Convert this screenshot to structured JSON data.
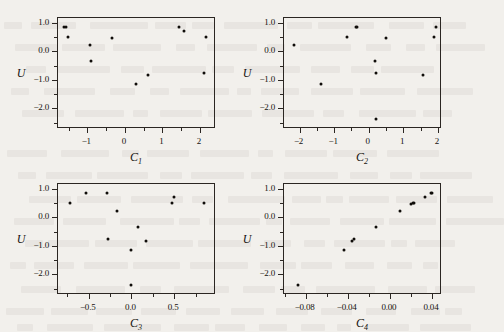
{
  "figure": {
    "background_color": "#f2f0ec",
    "ink_color": "#16130f",
    "layout": "2x2 grid of scatter plots",
    "ylabel": "U",
    "panels": [
      {
        "name": "panel-c1",
        "xlabel": "C",
        "xlabel_sub": "1",
        "xticks": [
          -1,
          0,
          1,
          2
        ],
        "xtick_labels": [
          "-1",
          "0",
          "1",
          "2"
        ],
        "xlim": [
          -1.78,
          2.43
        ],
        "yticks": [
          1.0,
          0.0,
          -1.0,
          -2.0
        ],
        "ytick_labels": [
          "1.0",
          "0.0",
          "-1.0",
          "-2.0"
        ],
        "ylim": [
          -2.72,
          1.17
        ]
      },
      {
        "name": "panel-c2",
        "xlabel": "C",
        "xlabel_sub": "2",
        "xticks": [
          -2,
          -1,
          0,
          1,
          2
        ],
        "xtick_labels": [
          "-2",
          "-1",
          "0",
          "1",
          "2"
        ],
        "xlim": [
          -2.45,
          2.12
        ],
        "yticks": [
          1.0,
          0.0,
          -1.0,
          -2.0
        ],
        "ytick_labels": [
          "1.0",
          "0.0",
          "-1.0",
          "-2.0"
        ],
        "ylim": [
          -2.72,
          1.17
        ]
      },
      {
        "name": "panel-c3",
        "xlabel": "C",
        "xlabel_sub": "3",
        "xticks": [
          -0.5,
          0.0,
          0.5
        ],
        "xtick_labels": [
          "-0.5",
          "0.0",
          "0.5"
        ],
        "xlim": [
          -0.86,
          0.99
        ],
        "yticks": [
          1.0,
          0.0,
          -1.0,
          -2.0
        ],
        "ytick_labels": [
          "1.0",
          "0.0",
          "-1.0",
          "-2.0"
        ],
        "ylim": [
          -2.72,
          1.17
        ]
      },
      {
        "name": "panel-c4",
        "xlabel": "C",
        "xlabel_sub": "4",
        "xticks": [
          -0.08,
          -0.04,
          0.0,
          0.04
        ],
        "xtick_labels": [
          "-0.08",
          "-0.04",
          "0.00",
          "0.04"
        ],
        "xlim": [
          -0.1005,
          0.0495
        ],
        "yticks": [
          1.0,
          0.0,
          -1.0,
          -2.0
        ],
        "ytick_labels": [
          "1.0",
          "0.0",
          "-1.0",
          "-2.0"
        ],
        "ylim": [
          -2.72,
          1.17
        ]
      }
    ]
  },
  "chart_data": [
    {
      "type": "scatter",
      "title": "",
      "xlabel": "C_1",
      "ylabel": "U",
      "xlim": [
        -1.78,
        2.43
      ],
      "ylim": [
        -2.72,
        1.17
      ],
      "grid": false,
      "legend": "none",
      "x": [
        -1.62,
        -1.58,
        -1.52,
        -0.93,
        -0.9,
        -0.35,
        0.3,
        0.62,
        1.44,
        1.59,
        2.12,
        2.17
      ],
      "y": [
        0.86,
        0.84,
        0.5,
        0.22,
        -0.32,
        0.46,
        -1.16,
        -0.83,
        0.87,
        0.7,
        -0.77,
        0.5
      ],
      "n_points": 12
    },
    {
      "type": "scatter",
      "title": "",
      "xlabel": "C_2",
      "ylabel": "U",
      "xlim": [
        -2.45,
        2.12
      ],
      "ylim": [
        -2.72,
        1.17
      ],
      "grid": false,
      "legend": "none",
      "x": [
        -2.17,
        -1.37,
        -0.63,
        -0.36,
        -0.33,
        0.17,
        0.2,
        0.22,
        0.5,
        1.58,
        1.88,
        1.94
      ],
      "y": [
        0.22,
        -1.16,
        0.5,
        0.86,
        0.84,
        -0.32,
        -0.77,
        -2.37,
        0.46,
        -0.83,
        0.5,
        0.87
      ],
      "n_points": 12
    },
    {
      "type": "scatter",
      "title": "",
      "xlabel": "C_3",
      "ylabel": "U",
      "xlim": [
        -0.86,
        0.99
      ],
      "ylim": [
        -2.72,
        1.17
      ],
      "grid": false,
      "legend": "none",
      "x": [
        -0.72,
        -0.53,
        -0.29,
        -0.28,
        -0.17,
        -0.01,
        0.0,
        0.08,
        0.17,
        0.48,
        0.5,
        0.85
      ],
      "y": [
        0.5,
        0.87,
        0.86,
        -0.77,
        0.22,
        -1.16,
        -2.37,
        -0.32,
        -0.83,
        0.5,
        0.7,
        0.5
      ],
      "n_points": 12
    },
    {
      "type": "scatter",
      "title": "",
      "xlabel": "C_4",
      "ylabel": "U",
      "xlim": [
        -0.1005,
        0.0495
      ],
      "ylim": [
        -2.72,
        1.17
      ],
      "grid": false,
      "legend": "none",
      "x": [
        -0.0875,
        -0.0435,
        -0.036,
        -0.0345,
        -0.013,
        0.01,
        0.02,
        0.0215,
        0.023,
        0.033,
        0.0395,
        0.04
      ],
      "y": [
        -2.37,
        -1.16,
        -0.83,
        -0.77,
        -0.32,
        0.22,
        0.46,
        0.5,
        0.5,
        0.7,
        0.86,
        0.87
      ],
      "n_points": 12
    }
  ]
}
